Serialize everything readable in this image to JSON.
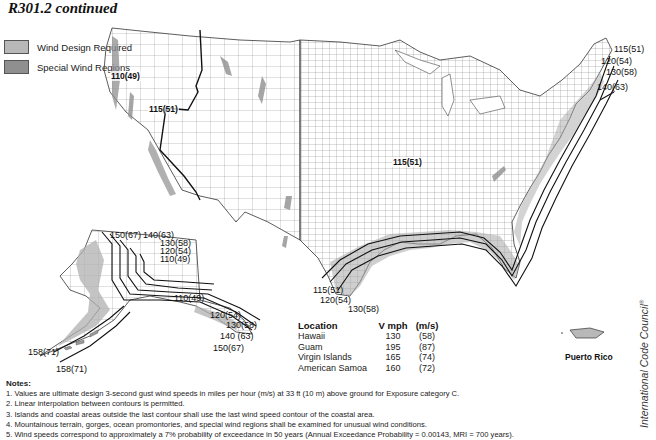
{
  "title": "R301.2 continued",
  "legend": {
    "items": [
      {
        "label": "Wind Design Required",
        "color": "#b8b8b8"
      },
      {
        "label": "Special Wind Regions",
        "color": "#8f8f8f"
      }
    ]
  },
  "map": {
    "conus_labels": [
      {
        "text": "110(49)",
        "x": 138,
        "y": 76
      },
      {
        "text": "115(51)",
        "x": 177,
        "y": 108
      },
      {
        "text": "115(51)",
        "x": 393,
        "y": 160
      }
    ],
    "east_coast_labels": [
      {
        "text": "115(51)",
        "x": 614,
        "y": 45
      },
      {
        "text": "120(54)",
        "x": 601,
        "y": 57
      },
      {
        "text": "130(58)",
        "x": 606,
        "y": 68
      },
      {
        "text": "140(63)",
        "x": 597,
        "y": 83
      }
    ],
    "gulf_labels": [
      {
        "text": "115(51)",
        "x": 313,
        "y": 285
      },
      {
        "text": "120(54)",
        "x": 320,
        "y": 295
      },
      {
        "text": "130(58)",
        "x": 348,
        "y": 303
      }
    ],
    "alaska_labels": [
      {
        "text": "150(67)",
        "x": 110,
        "y": 231
      },
      {
        "text": "140(63)",
        "x": 143,
        "y": 231
      },
      {
        "text": "130(58)",
        "x": 160,
        "y": 239
      },
      {
        "text": "120(54)",
        "x": 160,
        "y": 247
      },
      {
        "text": "110(49)",
        "x": 160,
        "y": 255
      },
      {
        "text": "110(49)",
        "x": 175,
        "y": 296
      },
      {
        "text": "120(54)",
        "x": 210,
        "y": 313
      },
      {
        "text": "130(58)",
        "x": 226,
        "y": 322
      },
      {
        "text": "140 (63)",
        "x": 220,
        "y": 333
      },
      {
        "text": "150(67)",
        "x": 213,
        "y": 345
      },
      {
        "text": "158(71)",
        "x": 28,
        "y": 349
      },
      {
        "text": "158(71)",
        "x": 56,
        "y": 366
      }
    ],
    "puerto_rico_label": "Puerto Rico"
  },
  "location_table": {
    "headers": [
      "Location",
      "V mph",
      "(m/s)"
    ],
    "rows": [
      [
        "Hawaii",
        "130",
        "(58)"
      ],
      [
        "Guam",
        "195",
        "(87)"
      ],
      [
        "Virgin Islands",
        "165",
        "(74)"
      ],
      [
        "American Samoa",
        "160",
        "(72)"
      ]
    ]
  },
  "notes": {
    "title": "Notes:",
    "items": [
      "1. Values are ultimate design 3-second gust wind speeds in miles per hour (m/s) at 33 ft (10 m) above ground for Exposure category C.",
      "2. Linear interpolation between contours is permitted.",
      "3. Islands and coastal areas outside the last contour shall use the last wind speed contour of the coastal area.",
      "4. Mountainous terrain, gorges, ocean promontories, and special wind regions shall be examined for unusual wind conditions.",
      "5. Wind speeds correspond to approximately a 7% probability of exceedance in 50 years (Annual Exceedance Probability = 0.00143, MRI = 700 years)."
    ]
  },
  "credit": {
    "text": "International Code Council",
    "mark": "®"
  }
}
